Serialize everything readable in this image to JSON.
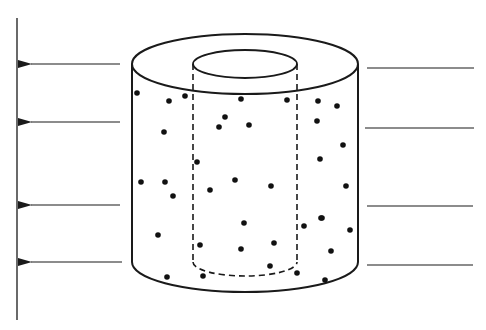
{
  "diagram": {
    "colors": {
      "stroke": "#1a1a1a",
      "background": "#ffffff",
      "dot": "#111111"
    },
    "plane": {
      "x": 17,
      "y1": 18,
      "y2": 320
    },
    "incoming_lines": [
      {
        "x1": 367,
        "x2": 474,
        "y": 68
      },
      {
        "x1": 365,
        "x2": 474,
        "y": 128
      },
      {
        "x1": 367,
        "x2": 473,
        "y": 206
      },
      {
        "x1": 367,
        "x2": 473,
        "y": 265
      }
    ],
    "outgoing_arrows": [
      {
        "x1": 120,
        "x2": 19,
        "y": 64
      },
      {
        "x1": 120,
        "x2": 19,
        "y": 122
      },
      {
        "x1": 120,
        "x2": 19,
        "y": 205
      },
      {
        "x1": 122,
        "x2": 19,
        "y": 262
      }
    ],
    "outer_cylinder": {
      "cx": 245,
      "top_cy": 64,
      "bottom_cy": 262,
      "rx": 113,
      "ry": 30
    },
    "inner_cylinder": {
      "cx": 245,
      "top_cy": 64,
      "bottom_cy": 262,
      "rx": 52,
      "ry": 14
    },
    "dots": [
      [
        137,
        93
      ],
      [
        169,
        101
      ],
      [
        185,
        96
      ],
      [
        241,
        99
      ],
      [
        287,
        100
      ],
      [
        318,
        101
      ],
      [
        337,
        106
      ],
      [
        164,
        132
      ],
      [
        225,
        117
      ],
      [
        219,
        127
      ],
      [
        249,
        125
      ],
      [
        317,
        121
      ],
      [
        343,
        145
      ],
      [
        197,
        162
      ],
      [
        320,
        159
      ],
      [
        141,
        182
      ],
      [
        165,
        182
      ],
      [
        173,
        196
      ],
      [
        210,
        190
      ],
      [
        235,
        180
      ],
      [
        271,
        186
      ],
      [
        346,
        186
      ],
      [
        321,
        218
      ],
      [
        158,
        235
      ],
      [
        244,
        223
      ],
      [
        304,
        226
      ],
      [
        322,
        218
      ],
      [
        350,
        230
      ],
      [
        200,
        245
      ],
      [
        241,
        249
      ],
      [
        274,
        243
      ],
      [
        331,
        251
      ],
      [
        167,
        277
      ],
      [
        203,
        276
      ],
      [
        270,
        266
      ],
      [
        297,
        273
      ],
      [
        325,
        280
      ]
    ]
  }
}
